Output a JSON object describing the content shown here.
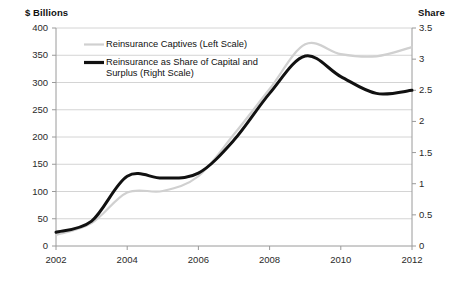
{
  "chart_data": {
    "type": "line",
    "title": "",
    "xlabel": "",
    "left_axis": {
      "label": "$ Billions",
      "ticks": [
        "0",
        "50",
        "100",
        "150",
        "200",
        "250",
        "300",
        "350",
        "400"
      ],
      "min": 0,
      "max": 400,
      "step": 50
    },
    "right_axis": {
      "label": "Share",
      "ticks": [
        "0",
        "0.5",
        "1",
        "1.5",
        "2",
        "2.5",
        "3",
        "3.5"
      ],
      "min": 0,
      "max": 3.5,
      "step": 0.5
    },
    "x": [
      2002,
      2003,
      2004,
      2005,
      2006,
      2007,
      2008,
      2009,
      2010,
      2011,
      2012
    ],
    "xticks": [
      "2002",
      "2004",
      "2006",
      "2008",
      "2010",
      "2012"
    ],
    "xlim": [
      2002,
      2012
    ],
    "grid": true,
    "legend_position": "top-center",
    "series": [
      {
        "name": "Reinsurance Captives (Left Scale)",
        "axis": "left",
        "color": "#d0d0d0",
        "width": 2.2,
        "values": [
          20,
          42,
          98,
          101,
          128,
          205,
          288,
          370,
          352,
          348,
          365
        ]
      },
      {
        "name": "Reinsurance as Share of Capital and Surplus (Right Scale)",
        "axis": "right",
        "color": "#111111",
        "width": 3.0,
        "values": [
          0.22,
          0.4,
          1.12,
          1.09,
          1.17,
          1.7,
          2.45,
          3.05,
          2.72,
          2.45,
          2.5
        ]
      }
    ]
  },
  "legend": {
    "items": [
      {
        "label": "Reinsurance Captives (Left Scale)"
      },
      {
        "label_line1": "Reinsurance as Share of Capital and",
        "label_line2": "Surplus (Right Scale)"
      }
    ]
  }
}
